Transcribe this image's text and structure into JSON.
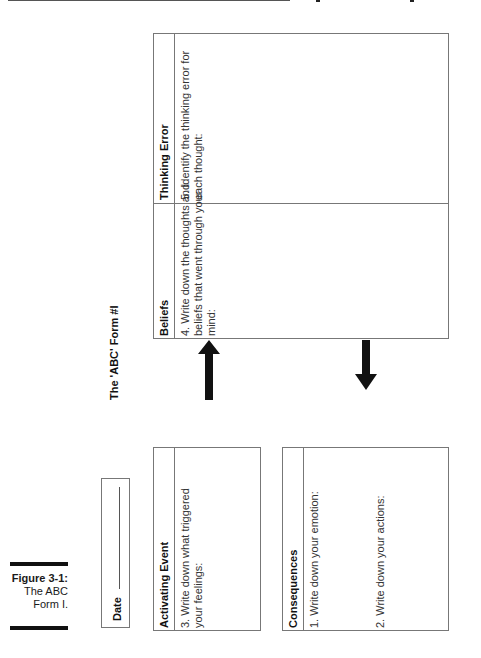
{
  "page": {
    "top_rule": true
  },
  "caption": {
    "label": "Figure 3-1:",
    "line1": "The ABC",
    "line2": "Form I."
  },
  "form": {
    "title": "The 'ABC' Form #I",
    "date_label": "Date",
    "sections": {
      "activating_event": {
        "heading": "Activating Event",
        "prompt_line1": "3. Write down what triggered",
        "prompt_line2": "your feelings:"
      },
      "beliefs": {
        "heading": "Beliefs",
        "prompt_line1": "4. Write down the thoughts and",
        "prompt_line2": "beliefs that went through your",
        "prompt_line3": "mind:"
      },
      "thinking_error": {
        "heading": "Thinking Error",
        "prompt_line1": "5. Identify the thinking error for",
        "prompt_line2": "each thought:"
      },
      "consequences": {
        "heading": "Consequences",
        "prompt_1": "1. Write down your emotion:",
        "prompt_2": "2. Write down your actions:"
      }
    },
    "arrows": [
      {
        "name": "activating-to-beliefs",
        "direction": "up"
      },
      {
        "name": "beliefs-to-consequences",
        "direction": "down"
      }
    ]
  }
}
